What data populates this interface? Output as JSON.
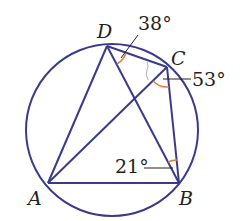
{
  "diagram": {
    "colors": {
      "line": "#3b3a8a",
      "angle_arc": "#e07b39",
      "leader": "#231f20",
      "text": "#231f20",
      "background": "#ffffff"
    },
    "circle": {
      "cx": 112,
      "cy": 130,
      "r": 86
    },
    "points": {
      "A": {
        "label": "A",
        "x": 48,
        "y": 183
      },
      "B": {
        "label": "B",
        "x": 179,
        "y": 183
      },
      "C": {
        "label": "C",
        "x": 167,
        "y": 67
      },
      "D": {
        "label": "D",
        "x": 107,
        "y": 46
      }
    },
    "segments": [
      "AB",
      "BC",
      "CD",
      "DA",
      "AC",
      "BD"
    ],
    "angles": [
      {
        "id": "angle-ADB-region",
        "vertex": "D",
        "value": "38°",
        "between": [
          "DB",
          "DC"
        ]
      },
      {
        "id": "angle-ACB",
        "vertex": "C",
        "value": "53°",
        "between": [
          "CA",
          "CB"
        ]
      },
      {
        "id": "angle-DBC",
        "vertex": "B",
        "value": "21°",
        "between": [
          "BD",
          "BC"
        ]
      }
    ],
    "labels": {
      "A": "A",
      "B": "B",
      "C": "C",
      "D": "D",
      "angle_D": "38°",
      "angle_C": "53°",
      "angle_B": "21°"
    }
  }
}
